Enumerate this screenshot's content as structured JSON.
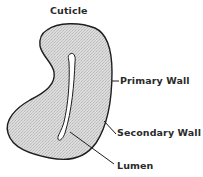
{
  "diagram": {
    "colors": {
      "fill": "#d6d6d6",
      "outline": "#1e1e1e",
      "lumen": "#ffffff",
      "text": "#2a2a2a",
      "background": "#ffffff"
    },
    "labels": {
      "cuticle": "Cuticle",
      "primary_wall": "Primary Wall",
      "secondary_wall": "Secondary Wall",
      "lumen": "Lumen"
    }
  }
}
